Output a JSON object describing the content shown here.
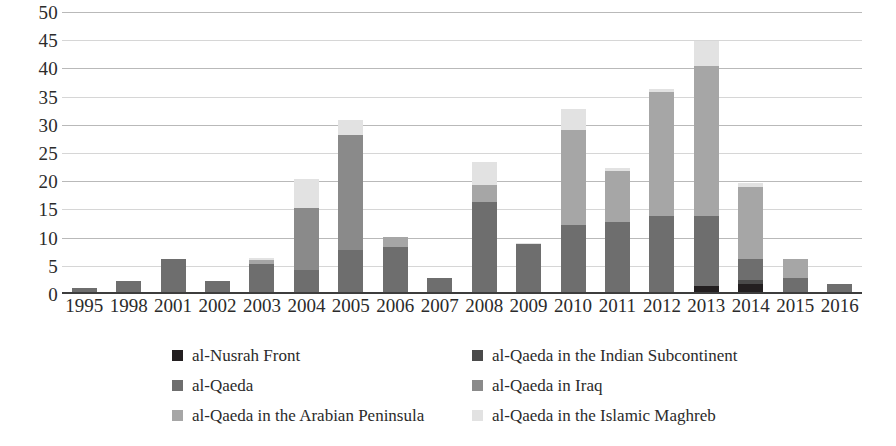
{
  "chart_data": {
    "type": "bar",
    "subtype": "stacked-bar",
    "title": "",
    "subtitle": "",
    "xlabel": "",
    "ylabel": "",
    "ylim": [
      0,
      50
    ],
    "ytick_step": 5,
    "grid": true,
    "legend_position": "bottom",
    "categories": [
      "1995",
      "1998",
      "2001",
      "2002",
      "2003",
      "2004",
      "2005",
      "2006",
      "2007",
      "2008",
      "2009",
      "2010",
      "2011",
      "2012",
      "2013",
      "2014",
      "2015",
      "2016"
    ],
    "ytick_labels": [
      "0",
      "5",
      "10",
      "15",
      "20",
      "25",
      "30",
      "35",
      "40",
      "45",
      "50"
    ],
    "series": [
      {
        "name": "al-Nusrah Front",
        "color": "#231f20",
        "values": [
          0,
          0,
          0,
          0,
          0,
          0,
          0,
          0,
          0,
          0,
          0,
          0,
          0,
          0,
          1.0,
          1.5,
          0,
          0
        ]
      },
      {
        "name": "al-Qaeda in the Indian Subcontinent",
        "color": "#4a4a4a",
        "values": [
          0,
          0,
          0,
          0,
          0,
          0,
          0,
          0,
          0,
          0,
          0,
          0,
          0,
          0,
          0,
          0.6,
          0,
          0
        ]
      },
      {
        "name": "al-Qaeda",
        "color": "#6e6e6e",
        "values": [
          0.8,
          1.9,
          5.8,
          1.9,
          5.0,
          3.9,
          7.4,
          8.0,
          2.4,
          16.0,
          8.6,
          11.8,
          12.4,
          13.4,
          12.5,
          3.7,
          2.4,
          1.4
        ]
      },
      {
        "name": "al-Qaeda in Iraq",
        "color": "#8a8a8a",
        "values": [
          0,
          0,
          0,
          0,
          0,
          11.0,
          20.4,
          0,
          0,
          0,
          0,
          0,
          0,
          0,
          0,
          0,
          0,
          0
        ]
      },
      {
        "name": "al-Qaeda in the Arabian Peninsula",
        "color": "#a6a6a6",
        "values": [
          0,
          0,
          0,
          0,
          0.6,
          0,
          0,
          1.7,
          0,
          3.0,
          0,
          17.0,
          9.1,
          22.1,
          26.6,
          12.8,
          3.4,
          0
        ]
      },
      {
        "name": "al-Qaeda in the Islamic Maghreb",
        "color": "#e2e2e2",
        "values": [
          0,
          0,
          0,
          0,
          0.5,
          5.1,
          2.7,
          0.1,
          0,
          4.0,
          0.1,
          3.7,
          0.5,
          0.5,
          4.4,
          0.8,
          0,
          0.1
        ]
      }
    ],
    "totals": [
      0.8,
      1.9,
      5.8,
      1.9,
      6.1,
      20.0,
      30.5,
      9.8,
      2.4,
      23.0,
      8.7,
      32.5,
      22.0,
      36.0,
      44.5,
      19.4,
      5.8,
      1.5
    ]
  },
  "legend": {
    "entries": [
      {
        "label": "al-Nusrah Front",
        "color": "#231f20"
      },
      {
        "label": "al-Qaeda in the Indian Subcontinent",
        "color": "#4a4a4a"
      },
      {
        "label": "al-Qaeda",
        "color": "#6e6e6e"
      },
      {
        "label": "al-Qaeda in Iraq",
        "color": "#8a8a8a"
      },
      {
        "label": "al-Qaeda in the Arabian Peninsula",
        "color": "#a6a6a6"
      },
      {
        "label": "al-Qaeda in the Islamic Maghreb",
        "color": "#e2e2e2"
      }
    ]
  }
}
